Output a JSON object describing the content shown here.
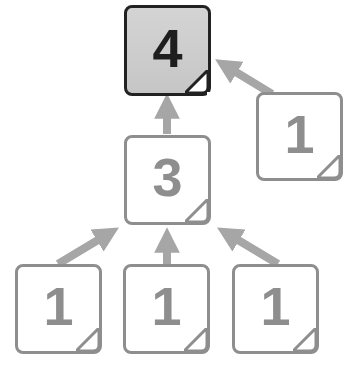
{
  "colors": {
    "faded_stroke": "#8e8e8e",
    "arrow": "#a6a6a6",
    "main_stroke": "#222222",
    "main_fill": "#cccccc",
    "main_text": "#1e1e1e"
  },
  "nodes": [
    {
      "id": "top",
      "label": "4",
      "style": "main"
    },
    {
      "id": "right",
      "label": "1",
      "style": "faded"
    },
    {
      "id": "middle",
      "label": "3",
      "style": "faded"
    },
    {
      "id": "bottom-left",
      "label": "1",
      "style": "faded"
    },
    {
      "id": "bottom-center",
      "label": "1",
      "style": "faded"
    },
    {
      "id": "bottom-right",
      "label": "1",
      "style": "faded"
    }
  ],
  "edges": [
    {
      "from": "right",
      "to": "top"
    },
    {
      "from": "middle",
      "to": "top"
    },
    {
      "from": "bottom-left",
      "to": "middle"
    },
    {
      "from": "bottom-center",
      "to": "middle"
    },
    {
      "from": "bottom-right",
      "to": "middle"
    }
  ]
}
